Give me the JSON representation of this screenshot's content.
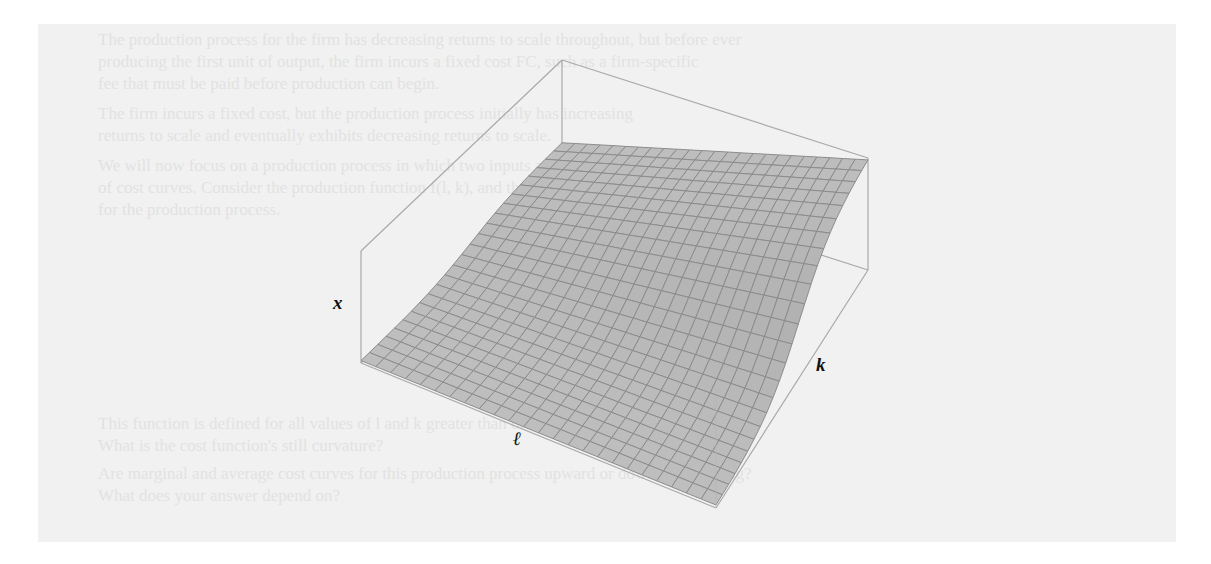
{
  "figure": {
    "kind": "3d-surface-plot",
    "axes": {
      "vertical": "x",
      "right_depth": "k",
      "front_depth": "ℓ"
    },
    "surface_fill": "#bdbdbd",
    "grid_color": "#8c8c8c",
    "box_color": "#a9a9a9",
    "grid_cells": 24
  },
  "background": {
    "panel_color": "#f1f1f1",
    "bleed_through_lines": [
      "The production process for the firm has decreasing returns to scale throughout, but before ever",
      "producing the first unit of output, the firm incurs a fixed cost FC, such as a firm-specific",
      "fee that must be paid before production can begin.",
      "The firm incurs a fixed cost, but the production process initially has increasing",
      "returns to scale and eventually exhibits decreasing returns to scale.",
      "We will now focus on a production process in which two inputs are used, and on the shape",
      "of cost curves. Consider the production function f(l, k), and the cost function",
      "for the production process.",
      "",
      "This function is defined for all values of l and k greater than or equal to zero.",
      "What is the cost function's still curvature?",
      "Are marginal and average cost curves for this production process upward or downward sloping?",
      "What does your answer depend on?"
    ]
  }
}
